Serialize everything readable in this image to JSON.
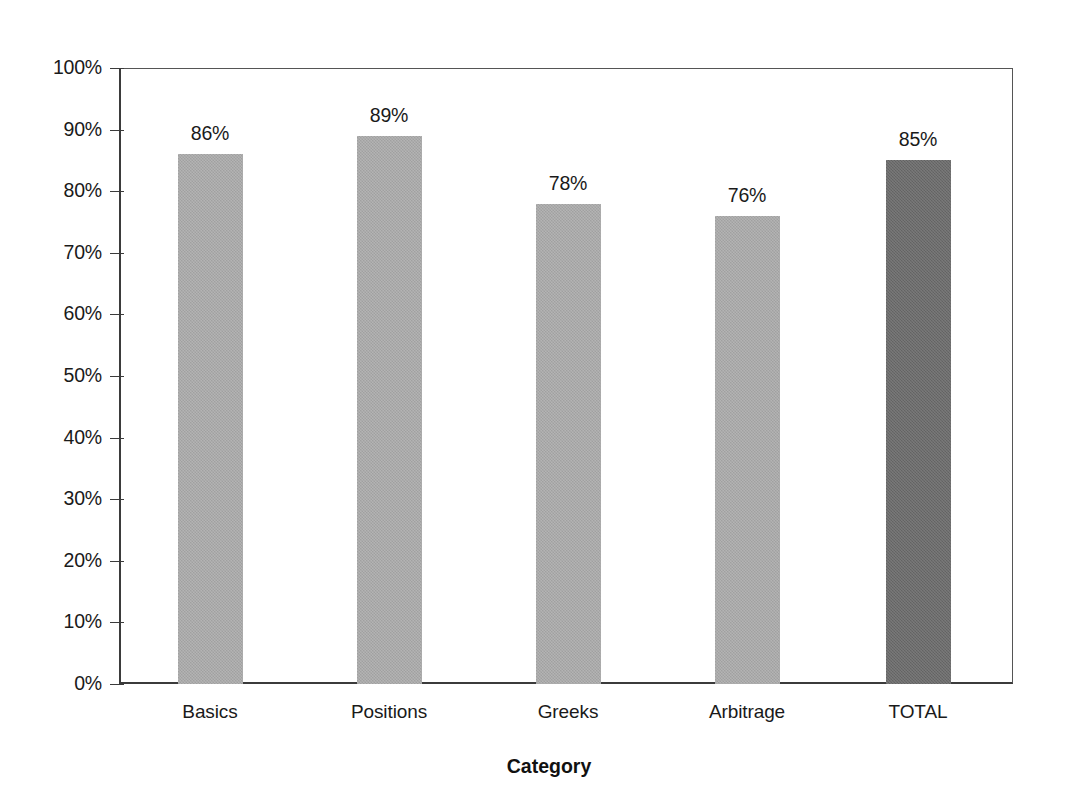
{
  "chart_data": {
    "type": "bar",
    "title": "",
    "xlabel": "Category",
    "ylabel": "",
    "categories": [
      "Basics",
      "Positions",
      "Greeks",
      "Arbitrage",
      "TOTAL"
    ],
    "values": [
      86,
      89,
      78,
      76,
      85
    ],
    "value_labels": [
      "86%",
      "89%",
      "78%",
      "76%",
      "85%"
    ],
    "ylim": [
      0,
      100
    ],
    "ytick_values": [
      0,
      10,
      20,
      30,
      40,
      50,
      60,
      70,
      80,
      90,
      100
    ],
    "ytick_labels": [
      "0%",
      "10%",
      "20%",
      "30%",
      "40%",
      "50%",
      "60%",
      "70%",
      "80%",
      "90%",
      "100%"
    ],
    "grid": false,
    "legend": "none",
    "series": [
      {
        "name": "Score",
        "values": [
          86,
          89,
          78,
          76,
          85
        ]
      }
    ],
    "bar_colors": [
      "#a9a9a9",
      "#a9a9a9",
      "#a9a9a9",
      "#a9a9a9",
      "#6a6a6a"
    ],
    "highlight_category": "TOTAL",
    "colors": {
      "bar_light": "#a9a9a9",
      "bar_dark": "#6a6a6a",
      "axis": "#3b3b3b",
      "text": "#1a1a1a",
      "background": "#ffffff"
    }
  }
}
